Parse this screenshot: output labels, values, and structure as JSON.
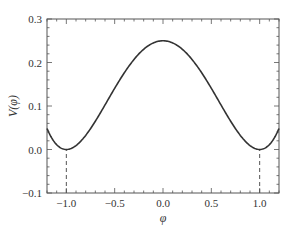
{
  "chart_data": {
    "type": "line",
    "title": "",
    "xlabel": "φ",
    "ylabel": "V(φ)",
    "xlim": [
      -1.2,
      1.2
    ],
    "ylim": [
      -0.1,
      0.3
    ],
    "xticks": [
      -1.0,
      -0.5,
      0.0,
      0.5,
      1.0
    ],
    "xtick_labels": [
      "−1.0",
      "−0.5",
      "0.0",
      "0.5",
      "1.0"
    ],
    "yticks": [
      -0.1,
      0.0,
      0.1,
      0.2,
      0.3
    ],
    "ytick_labels": [
      "−0.1",
      "0.0",
      "0.1",
      "0.2",
      "0.3"
    ],
    "grid": false,
    "legend": null,
    "series": [
      {
        "name": "V(φ)",
        "x": [
          -1.2,
          -1.1,
          -1.0,
          -0.9,
          -0.8,
          -0.7,
          -0.6,
          -0.5,
          -0.4,
          -0.3,
          -0.2,
          -0.1,
          0.0,
          0.1,
          0.2,
          0.3,
          0.4,
          0.5,
          0.6,
          0.7,
          0.8,
          0.9,
          1.0,
          1.1,
          1.2
        ],
        "y": [
          0.0484,
          0.011,
          0.0,
          0.009,
          0.0324,
          0.065,
          0.1024,
          0.1406,
          0.1764,
          0.207,
          0.2304,
          0.245,
          0.25,
          0.245,
          0.2304,
          0.207,
          0.1764,
          0.1406,
          0.1024,
          0.065,
          0.0324,
          0.009,
          0.0,
          0.011,
          0.0484
        ],
        "style": "solid",
        "color": "#333333"
      }
    ],
    "annotations": [
      {
        "type": "vline",
        "x": -1.0,
        "from_y": -0.1,
        "to_y": 0.0,
        "style": "dashed"
      },
      {
        "type": "vline",
        "x": 1.0,
        "from_y": -0.1,
        "to_y": 0.0,
        "style": "dashed"
      }
    ]
  },
  "labels": {
    "xlabel": "φ",
    "ylabel": "V(φ)"
  }
}
